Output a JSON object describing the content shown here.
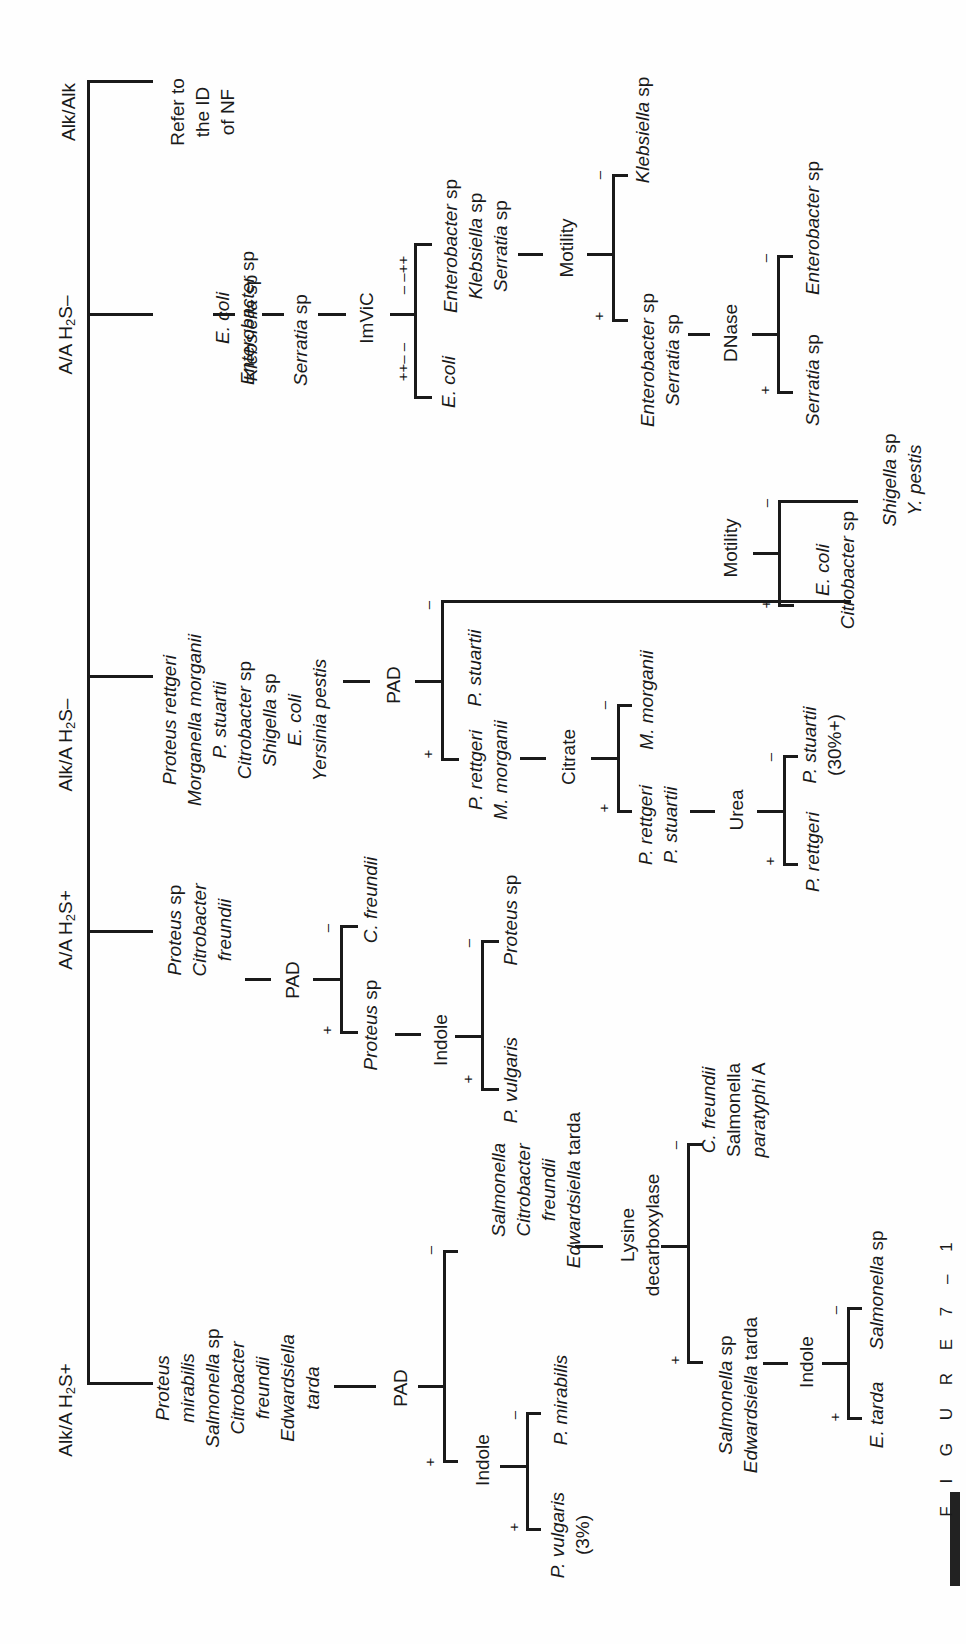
{
  "figure": {
    "caption": "F I G U R E   7 – 1"
  },
  "tsi_reactions": [
    {
      "label": "Alk/Alk"
    },
    {
      "label_pre": "A/A H",
      "label_sub": "2",
      "label_post": "S–"
    },
    {
      "label_pre": "Alk/A H",
      "label_sub": "2",
      "label_post": "S–"
    },
    {
      "label_pre": "A/A H",
      "label_sub": "2",
      "label_post": "S+"
    },
    {
      "label_pre": "Alk/A H",
      "label_sub": "2",
      "label_post": "S+"
    }
  ],
  "alk_alk": {
    "result": [
      "Refer to",
      "the ID",
      "of NF"
    ]
  },
  "aa_h2s_neg": {
    "organisms": [
      {
        "g": "E. coli",
        "s": ""
      },
      {
        "g": "Enterobacter",
        "s": " sp"
      },
      {
        "g": "Klebsiella",
        "s": " sp"
      },
      {
        "g": "Serratia",
        "s": " sp"
      }
    ],
    "test": "ImViC",
    "pos_code": "++– –",
    "neg_code": "– –++",
    "pos_result": "E. coli",
    "neg_result": [
      {
        "g": "Enterobacter",
        "s": " sp"
      },
      {
        "g": "Klebsiella",
        "s": " sp"
      },
      {
        "g": "Serratia",
        "s": " sp"
      }
    ],
    "motility": {
      "test": "Motility",
      "pos": [
        {
          "g": "Enterobacter",
          "s": " sp"
        },
        {
          "g": "Serratia",
          "s": " sp"
        }
      ],
      "neg": {
        "g": "Klebsiella",
        "s": " sp"
      }
    },
    "dnase": {
      "test": "DNase",
      "pos": {
        "g": "Serratia",
        "s": " sp"
      },
      "neg": {
        "g": "Enterobacter",
        "s": " sp"
      }
    }
  },
  "alka_h2s_neg": {
    "organisms": [
      {
        "g": "Proteus rettgeri",
        "s": ""
      },
      {
        "g": "Morganella morganii",
        "s": ""
      },
      {
        "g": "P. stuartii",
        "s": ""
      },
      {
        "g": "Citrobacter",
        "s": " sp"
      },
      {
        "g": "Shigella",
        "s": " sp"
      },
      {
        "g": "E. coli",
        "s": ""
      },
      {
        "g": "Yersinia pestis",
        "s": ""
      }
    ],
    "test": "PAD",
    "pos": [
      "P. rettgeri",
      "M. morganii"
    ],
    "neg": "P. stuartii",
    "citrate": {
      "test": "Citrate",
      "pos": [
        "P. rettgeri",
        "P. stuartii"
      ],
      "neg": "M. morganii"
    },
    "urea": {
      "test": "Urea",
      "pos": "P. rettgeri",
      "neg": "P. stuartii",
      "neg_note": "(30%+)"
    },
    "motility": {
      "test": "Motility",
      "pos": [
        {
          "g": "E. coli",
          "s": ""
        },
        {
          "g": "Citrobacter",
          "s": " sp"
        }
      ],
      "neg": [
        {
          "g": "Shigella",
          "s": " sp"
        },
        {
          "g": "Y. pestis",
          "s": ""
        }
      ]
    }
  },
  "aa_h2s_pos": {
    "organisms": [
      {
        "g": "Proteus",
        "s": " sp"
      },
      {
        "g": "Citrobacter",
        "s": ""
      },
      {
        "g": "freundii",
        "s": ""
      }
    ],
    "test": "PAD",
    "pos": {
      "g": "Proteus",
      "s": " sp"
    },
    "neg": "C. freundii",
    "indole": {
      "test": "Indole",
      "pos": "P. vulgaris",
      "neg": {
        "g": "Proteus",
        "s": " sp"
      }
    }
  },
  "alka_h2s_pos": {
    "organisms": [
      {
        "g": "Proteus",
        "s": ""
      },
      {
        "g": "mirabilis",
        "s": ""
      },
      {
        "g": "Salmonella",
        "s": " sp"
      },
      {
        "g": "Citrobacter",
        "s": ""
      },
      {
        "g": "freundii",
        "s": ""
      },
      {
        "g": "Edwardsiella",
        "s": ""
      },
      {
        "g": "tarda",
        "s": ""
      }
    ],
    "test": "PAD",
    "indole": {
      "test": "Indole",
      "pos": "P. vulgaris",
      "pos_note": "(3%)",
      "neg": "P. mirabilis"
    },
    "neg": [
      {
        "g": "Salmonella",
        "s": ""
      },
      {
        "g": "Citrobacter",
        "s": ""
      },
      {
        "g": "freundii",
        "s": ""
      },
      {
        "g": "Edwardsiella",
        "s": " tarda"
      }
    ],
    "lysine": {
      "test_line1": "Lysine",
      "test_line2": "decarboxylase",
      "pos": [
        {
          "g": "Salmonella",
          "s": " sp"
        },
        {
          "g": "Edwardsiella",
          "s": " tarda"
        }
      ],
      "neg": [
        {
          "g": "C. freundii",
          "s": "",
          "it": true
        },
        {
          "g": "Salmonella",
          "s": "",
          "it": false
        },
        {
          "g": "paratyphi",
          "s": " A",
          "it": true
        }
      ]
    },
    "indole2": {
      "test": "Indole",
      "pos": "E. tarda",
      "neg": {
        "g": "Salmonella",
        "s": " sp"
      }
    }
  },
  "signs": {
    "plus": "+",
    "minus": "–"
  }
}
